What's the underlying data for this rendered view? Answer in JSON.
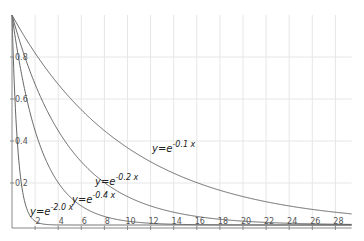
{
  "chart_data": {
    "type": "line",
    "title": "",
    "xlabel": "",
    "ylabel": "",
    "xlim": [
      0,
      29.4
    ],
    "ylim": [
      0,
      1
    ],
    "grid": true,
    "x_ticks": [
      "2",
      "4",
      "6",
      "8",
      "10",
      "12",
      "14",
      "16",
      "18",
      "20",
      "22",
      "24",
      "26",
      "28"
    ],
    "y_ticks": [
      "0.2",
      "0.4",
      "0.6",
      "0.8"
    ],
    "series": [
      {
        "name": "y=e^{-0.1x}",
        "k": 0.1,
        "label_base": "y=e",
        "label_exp": "-0.1 x",
        "label_pos": [
          152,
          152
        ]
      },
      {
        "name": "y=e^{-0.2x}",
        "k": 0.2,
        "label_base": "y=e",
        "label_exp": "-0.2 x",
        "label_pos": [
          95,
          185
        ]
      },
      {
        "name": "y=e^{-0.4x}",
        "k": 0.4,
        "label_base": "y=e",
        "label_exp": "-0.4 x",
        "label_pos": [
          72,
          203
        ]
      },
      {
        "name": "y=e^{-2.0x}",
        "k": 2.0,
        "label_base": "y=e",
        "label_exp": "-2.0 x",
        "label_pos": [
          30,
          215
        ]
      }
    ],
    "colors": {
      "curve": "#555555",
      "axis": "#888888",
      "grid": "#e6e6e6"
    }
  }
}
